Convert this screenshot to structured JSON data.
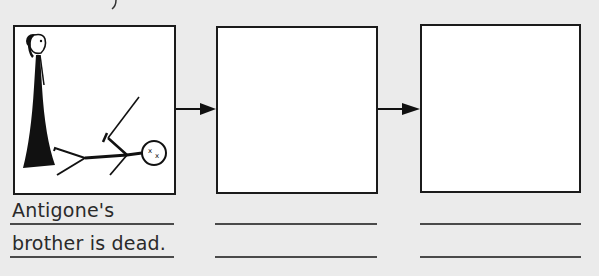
{
  "worksheet": {
    "panels": [
      {
        "label": "panel-1",
        "illustration": "Antigone standing beside her dead brother (stick figure lying on ground)",
        "caption_lines": [
          "Antigone's",
          "brother is dead."
        ]
      },
      {
        "label": "panel-2",
        "illustration": "",
        "caption_lines": [
          "",
          ""
        ]
      },
      {
        "label": "panel-3",
        "illustration": "",
        "caption_lines": [
          "",
          ""
        ]
      }
    ],
    "arrows": [
      "arrow-right-icon",
      "arrow-right-icon"
    ],
    "colors": {
      "background": "#ebebeb",
      "ink": "#1b1b1b",
      "frame_fill": "#ffffff"
    }
  }
}
